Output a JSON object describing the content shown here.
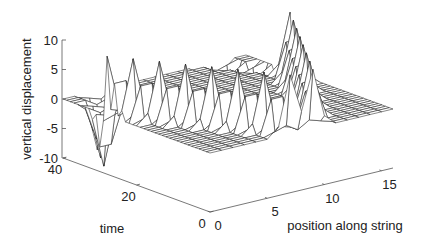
{
  "chart_data": {
    "type": "surface-mesh",
    "title": "",
    "xlabel": "position along string",
    "ylabel": "time",
    "zlabel": "vertical displacement",
    "xlim": [
      0,
      16
    ],
    "ylim": [
      0,
      40
    ],
    "zlim": [
      -10,
      10
    ],
    "x_ticks": [
      0,
      5,
      10,
      15
    ],
    "y_ticks": [
      0,
      20,
      40
    ],
    "z_ticks": [
      10,
      5,
      0,
      -5,
      -10
    ],
    "x_tick_labels": [
      "0",
      "5",
      "10",
      "15"
    ],
    "y_tick_labels": [
      "0",
      "20",
      "40"
    ],
    "z_tick_labels": [
      "10",
      "5",
      "0",
      "-5",
      "-10"
    ],
    "grid": false,
    "surface": {
      "description": "String displacement over time: at t=0 a pulse of height 10 near the middle splits into two pulses travelling outward toward both ends, reflecting with inverted sign (-10).",
      "x_points": 17,
      "t_points": 41,
      "pulse_amplitude": 10,
      "reflected_amplitude": -10
    }
  }
}
